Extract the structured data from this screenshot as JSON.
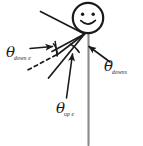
{
  "figure": {
    "background_color": "#ffffff",
    "stroke_color": "#1a1a1a",
    "labels": [
      {
        "id": "down-e",
        "name": "theta-down-e-label",
        "symbol": "θ",
        "subscript": "down e",
        "position": "left"
      },
      {
        "id": "downs",
        "name": "theta-downs-label",
        "symbol": "θ",
        "subscript": "downs",
        "position": "right"
      },
      {
        "id": "up-e",
        "name": "theta-up-e-label",
        "symbol": "θ",
        "subscript": "up e",
        "position": "bottom"
      }
    ],
    "parts": {
      "head": "smiley-face-head",
      "left_eye": "left-eye",
      "right_eye": "right-eye",
      "mouth": "smile-mouth",
      "body": "vertical-body-line",
      "ray_upper_left": "upper-left-ray",
      "ray_lower_left": "lower-left-ray",
      "ray_dashed": "dashed-reference-line",
      "arc_left": "left-angle-arc",
      "arc_right": "right-angle-arc",
      "arrow_left": "left-pointer-arrow",
      "arrow_right": "right-pointer-arrow",
      "arrow_bottom": "bottom-pointer-arrow"
    }
  }
}
